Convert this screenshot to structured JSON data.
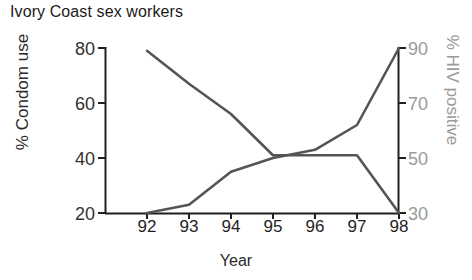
{
  "chart_data": {
    "type": "line",
    "title": "Ivory Coast sex workers",
    "xlabel": "Year",
    "ylabel": "% Condom use",
    "y2label": "% HIV positive",
    "categories": [
      "92",
      "93",
      "94",
      "95",
      "96",
      "97",
      "98"
    ],
    "x": [
      92,
      93,
      94,
      95,
      96,
      97,
      98
    ],
    "xlim": [
      91.6,
      98.2
    ],
    "ylim": [
      20,
      80
    ],
    "y2lim": [
      30,
      90
    ],
    "yticks": [
      "20",
      "40",
      "60",
      "80"
    ],
    "ytick_values": [
      20,
      40,
      60,
      80
    ],
    "y2ticks": [
      "30",
      "50",
      "70",
      "90"
    ],
    "y2tick_values": [
      30,
      50,
      70,
      90
    ],
    "grid": false,
    "legend": "none",
    "series": [
      {
        "name": "% Condom use",
        "axis": "left",
        "color": "#555555",
        "values": [
          20,
          23,
          35,
          40,
          43,
          52,
          80
        ]
      },
      {
        "name": "% HIV positive",
        "axis": "right",
        "color": "#555555",
        "values": [
          89,
          77,
          66,
          51,
          51,
          51,
          30
        ]
      }
    ]
  },
  "chart": {
    "title": "Ivory Coast sex workers",
    "axes": {
      "x": {
        "label": "Year",
        "ticks": [
          "92",
          "93",
          "94",
          "95",
          "96",
          "97",
          "98"
        ]
      },
      "y_left": {
        "label": "% Condom use",
        "ticks": [
          "20",
          "40",
          "60",
          "80"
        ]
      },
      "y_right": {
        "label": "% HIV positive",
        "ticks": [
          "30",
          "50",
          "70",
          "90"
        ]
      }
    },
    "colors": {
      "line": "#555555",
      "axis": "#1f1f1f",
      "right_axis_text": "#9a9a9a",
      "left_axis_text": "#333333",
      "title_text": "#1a1a1a",
      "background": "#ffffff"
    }
  }
}
